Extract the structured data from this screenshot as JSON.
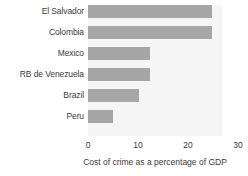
{
  "chart_data": {
    "type": "bar",
    "orientation": "horizontal",
    "title": "",
    "xlabel": "Cost of crime as a percentage of GDP",
    "ylabel": "",
    "xlim": [
      0,
      30
    ],
    "xticks": [
      0,
      10,
      20,
      30
    ],
    "xtick_labels": [
      "0",
      "10",
      "20",
      "30"
    ],
    "grid": false,
    "legend": null,
    "bar_color": "#a6a6a6",
    "plot_background": "#f5f5f5",
    "categories": [
      "El Salvador",
      "Colombia",
      "Mexico",
      "RB de Venezuela",
      "Brazil",
      "Peru"
    ],
    "values": [
      24.8,
      24.8,
      12.3,
      12.3,
      10.2,
      5.0
    ],
    "series": [
      {
        "name": "Cost of crime as a percentage of GDP",
        "values": [
          24.8,
          24.8,
          12.3,
          12.3,
          10.2,
          5.0
        ]
      }
    ]
  }
}
